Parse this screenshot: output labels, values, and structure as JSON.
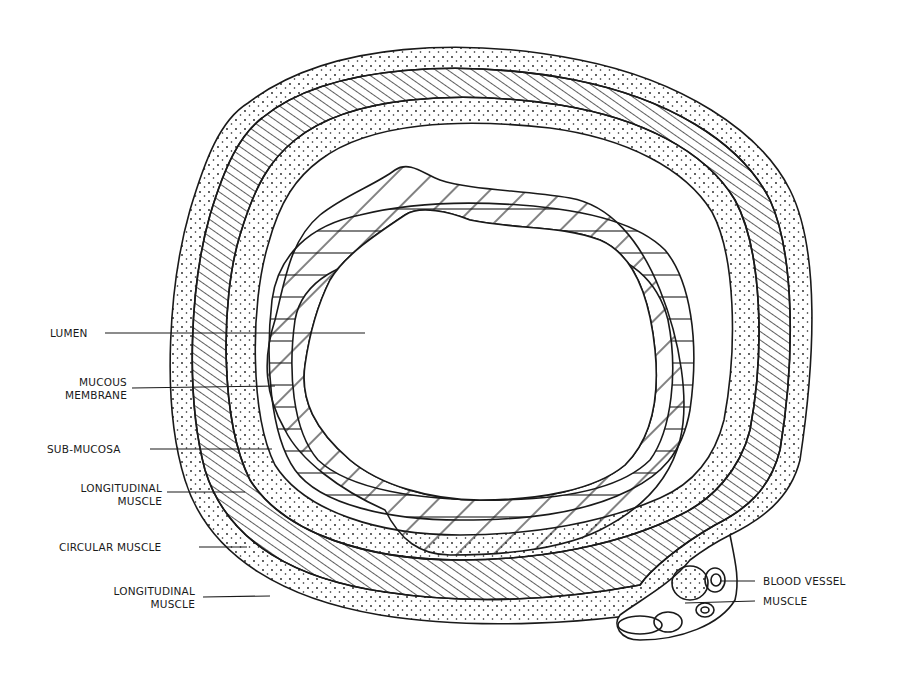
{
  "diagram": {
    "colors": {
      "ink": "#1a1a1a",
      "paper": "#ffffff"
    },
    "labels_left": [
      {
        "id": "lumen",
        "line1": "LUMEN",
        "line2": ""
      },
      {
        "id": "mucous-membrane",
        "line1": "MUCOUS",
        "line2": "MEMBRANE"
      },
      {
        "id": "sub-mucosa",
        "line1": "SUB-MUCOSA",
        "line2": ""
      },
      {
        "id": "longitudinal-muscle-inner",
        "line1": "LONGITUDINAL",
        "line2": "MUSCLE"
      },
      {
        "id": "circular-muscle",
        "line1": "CIRCULAR  MUSCLE",
        "line2": ""
      },
      {
        "id": "longitudinal-muscle-outer",
        "line1": "LONGITUDINAL",
        "line2": "MUSCLE"
      }
    ],
    "labels_right": [
      {
        "id": "blood-vessel",
        "line1": "BLOOD VESSEL"
      },
      {
        "id": "muscle",
        "line1": "MUSCLE"
      }
    ]
  }
}
